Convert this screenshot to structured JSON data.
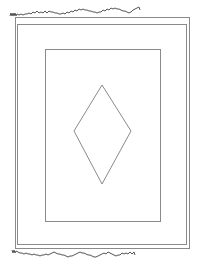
{
  "figure": {
    "stroke_color": "#8a8a8a",
    "fringe_color": "#555555",
    "background": "#ffffff"
  },
  "shapes": {
    "outer_border": {
      "x": 15,
      "y": 17,
      "w": 174,
      "h": 231
    },
    "middle_border": {
      "x": 17,
      "y": 24,
      "w": 169,
      "h": 220
    },
    "inner_panel": {
      "x": 45,
      "y": 49,
      "w": 115,
      "h": 172
    },
    "diamond": {
      "top": [
        102,
        85
      ],
      "right": [
        131,
        131
      ],
      "bottom": [
        102,
        184
      ],
      "left": [
        74,
        131
      ]
    }
  }
}
